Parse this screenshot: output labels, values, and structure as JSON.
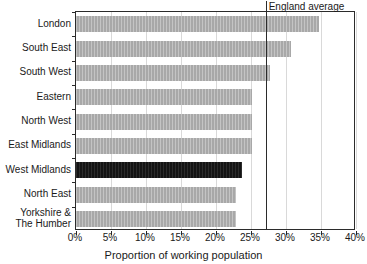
{
  "chart_data": {
    "type": "bar",
    "orientation": "horizontal",
    "title": "",
    "xlabel": "Proportion of working population",
    "ylabel": "",
    "categories": [
      "London",
      "South East",
      "South West",
      "Eastern",
      "North West",
      "East Midlands",
      "West Midlands",
      "North East",
      "Yorkshire &\nThe Humber"
    ],
    "values": [
      34.7,
      30.7,
      27.7,
      25.1,
      25.1,
      25.1,
      23.7,
      22.9,
      22.9
    ],
    "highlight_category": "West Midlands",
    "xlim": [
      0,
      40
    ],
    "xticks": [
      0,
      5,
      10,
      15,
      20,
      25,
      30,
      35,
      40
    ],
    "xticklabels": [
      "0%",
      "5%",
      "10%",
      "15%",
      "20%",
      "25%",
      "30%",
      "35%",
      "40%"
    ],
    "grid": "vertical",
    "legend": "none",
    "annotations": [
      {
        "name": "england-average",
        "label": "England average",
        "value": 27.1,
        "type": "vline"
      }
    ],
    "colors": {
      "bar": "#a8a8a8",
      "bar_highlight": "#141414",
      "axis": "#2b2b2b",
      "grid": "#d9d9d9",
      "text": "#1a1a1a",
      "background": "#ffffff"
    }
  }
}
